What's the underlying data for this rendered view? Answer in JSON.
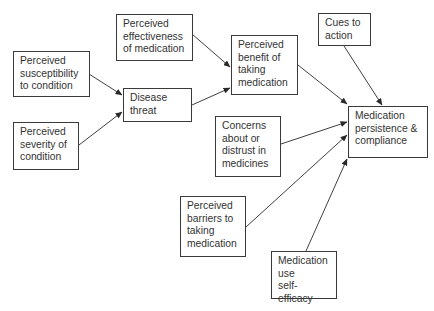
{
  "diagram": {
    "nodes": [
      {
        "id": "effectiveness",
        "label": "Perceived\neffectiveness\nof medication",
        "x": 116,
        "y": 14,
        "w": 77,
        "h": 47
      },
      {
        "id": "susceptibility",
        "label": "Perceived\nsusceptibility\nto condition",
        "x": 13,
        "y": 51,
        "w": 77,
        "h": 46
      },
      {
        "id": "severity",
        "label": "Perceived\nseverity of\ncondition",
        "x": 13,
        "y": 122,
        "w": 66,
        "h": 48
      },
      {
        "id": "disease_threat",
        "label": "Disease\nthreat",
        "x": 123,
        "y": 88,
        "w": 69,
        "h": 34
      },
      {
        "id": "benefit",
        "label": "Perceived\nbenefit of\ntaking\nmedication",
        "x": 231,
        "y": 35,
        "w": 67,
        "h": 60
      },
      {
        "id": "cues",
        "label": "Cues to\naction",
        "x": 318,
        "y": 13,
        "w": 53,
        "h": 33
      },
      {
        "id": "compliance",
        "label": "Medication\npersistence &\ncompliance",
        "x": 348,
        "y": 106,
        "w": 80,
        "h": 52
      },
      {
        "id": "concerns",
        "label": "Concerns\nabout or\ndistrust in\nmedicines",
        "x": 215,
        "y": 116,
        "w": 66,
        "h": 61
      },
      {
        "id": "barriers",
        "label": "Perceived\nbarriers to\ntaking\nmedication",
        "x": 180,
        "y": 196,
        "w": 66,
        "h": 61
      },
      {
        "id": "self_efficacy",
        "label": "Medication\nuse\nself-efficacy",
        "x": 271,
        "y": 251,
        "w": 66,
        "h": 48
      }
    ],
    "edges": [
      {
        "from": "susceptibility",
        "to": "disease_threat",
        "x1": 89,
        "y1": 74,
        "x2": 122,
        "y2": 95
      },
      {
        "from": "severity",
        "to": "disease_threat",
        "x1": 79,
        "y1": 145,
        "x2": 122,
        "y2": 112
      },
      {
        "from": "effectiveness",
        "to": "benefit",
        "x1": 192,
        "y1": 34,
        "x2": 230,
        "y2": 67
      },
      {
        "from": "disease_threat",
        "to": "benefit",
        "x1": 192,
        "y1": 105,
        "x2": 230,
        "y2": 88
      },
      {
        "from": "benefit",
        "to": "compliance",
        "x1": 298,
        "y1": 65,
        "x2": 347,
        "y2": 104
      },
      {
        "from": "cues",
        "to": "compliance",
        "x1": 344,
        "y1": 46,
        "x2": 382,
        "y2": 105
      },
      {
        "from": "concerns",
        "to": "compliance",
        "x1": 281,
        "y1": 144,
        "x2": 347,
        "y2": 122
      },
      {
        "from": "barriers",
        "to": "compliance",
        "x1": 246,
        "y1": 227,
        "x2": 347,
        "y2": 135
      },
      {
        "from": "self_efficacy",
        "to": "compliance",
        "x1": 306,
        "y1": 251,
        "x2": 347,
        "y2": 159
      }
    ],
    "colors": {
      "border": "#3a3a3a",
      "text": "#333333",
      "arrow": "#2a2a2a",
      "background": "#ffffff"
    }
  }
}
